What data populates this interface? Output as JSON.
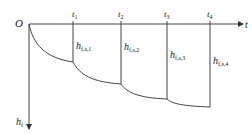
{
  "diagram": {
    "origin_label": "O",
    "x_axis_label": "t",
    "y_axis_label": "h",
    "y_axis_label_sub": "f",
    "time_marks": [
      {
        "label": "t",
        "sub": "1"
      },
      {
        "label": "t",
        "sub": "2"
      },
      {
        "label": "t",
        "sub": "3"
      },
      {
        "label": "t",
        "sub": "4"
      }
    ],
    "heights": [
      {
        "label": "h",
        "sub": "f,s,1"
      },
      {
        "label": "h",
        "sub": "f,s,2"
      },
      {
        "label": "h",
        "sub": "f,s,3"
      },
      {
        "label": "h",
        "sub": "f,s,4"
      }
    ],
    "line_color": "#444444"
  }
}
